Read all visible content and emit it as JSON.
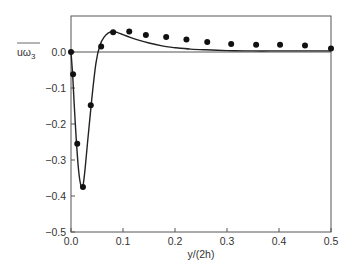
{
  "chart_data": {
    "type": "line",
    "title": "",
    "xlabel": "y/(2h)",
    "ylabel": "uω3 (overlined)",
    "ylabel_main": "uω",
    "ylabel_sub": "3",
    "xlim": [
      0.0,
      0.5
    ],
    "ylim": [
      -0.5,
      0.1
    ],
    "grid": false,
    "legend": null,
    "x_ticks": [
      "0.0",
      "0.1",
      "0.2",
      "0.3",
      "0.4",
      "0.5"
    ],
    "y_ticks": [
      "0.0",
      "−0.1",
      "−0.2",
      "−0.3",
      "−0.4",
      "−0.5"
    ],
    "x_tick_values": [
      0.0,
      0.1,
      0.2,
      0.3,
      0.4,
      0.5
    ],
    "y_tick_values": [
      0.0,
      -0.1,
      -0.2,
      -0.3,
      -0.4,
      -0.5
    ],
    "series": [
      {
        "name": "markers",
        "style": "scatter",
        "x": [
          0.0,
          0.004,
          0.012,
          0.023,
          0.038,
          0.058,
          0.081,
          0.112,
          0.144,
          0.183,
          0.222,
          0.262,
          0.308,
          0.356,
          0.402,
          0.45,
          0.5
        ],
        "y": [
          0.0,
          -0.062,
          -0.255,
          -0.375,
          -0.148,
          0.015,
          0.055,
          0.057,
          0.047,
          0.042,
          0.035,
          0.028,
          0.022,
          0.02,
          0.02,
          0.018,
          0.01
        ]
      },
      {
        "name": "solid curve",
        "style": "line",
        "x": [
          0.0,
          0.003,
          0.006,
          0.01,
          0.014,
          0.018,
          0.022,
          0.026,
          0.032,
          0.04,
          0.048,
          0.056,
          0.064,
          0.072,
          0.08,
          0.09,
          0.1,
          0.115,
          0.13,
          0.15,
          0.175,
          0.2,
          0.23,
          0.26,
          0.3,
          0.35,
          0.4,
          0.45,
          0.5
        ],
        "y": [
          0.0,
          -0.06,
          -0.14,
          -0.24,
          -0.32,
          -0.365,
          -0.378,
          -0.34,
          -0.25,
          -0.13,
          -0.03,
          0.02,
          0.042,
          0.053,
          0.057,
          0.054,
          0.048,
          0.04,
          0.033,
          0.025,
          0.017,
          0.012,
          0.008,
          0.006,
          0.004,
          0.003,
          0.003,
          0.003,
          0.003
        ]
      }
    ]
  }
}
